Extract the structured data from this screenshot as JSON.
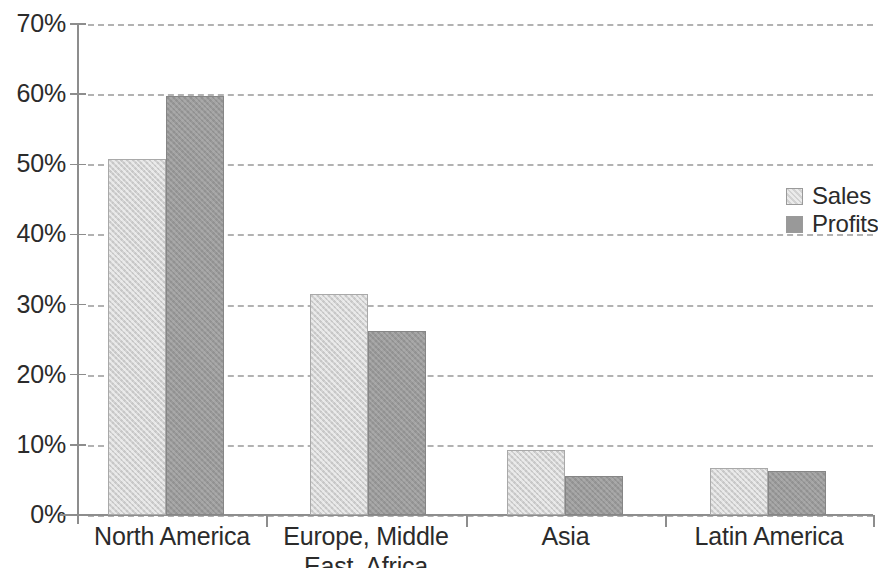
{
  "chart_data": {
    "type": "bar",
    "title": "",
    "subtitle": "",
    "xlabel": "",
    "ylabel": "",
    "categories": [
      "North America",
      "Europe, Middle East, Africa",
      "Asia",
      "Latin America"
    ],
    "series": [
      {
        "name": "Sales",
        "color": "#d2d2d2",
        "values": [
          50.7,
          31.5,
          9.3,
          6.7
        ]
      },
      {
        "name": "Profits",
        "color": "#999999",
        "values": [
          59.8,
          26.2,
          5.6,
          6.3
        ]
      }
    ],
    "ylim": [
      0,
      70
    ],
    "ytick_values": [
      70,
      60,
      50,
      40,
      30,
      20,
      10,
      0
    ],
    "ytick_labels": [
      "70%",
      "60%",
      "50%",
      "40%",
      "30%",
      "20%",
      "10%",
      "0%"
    ],
    "grid": "horizontal-dashed",
    "legend_position": "right",
    "legend_entries": [
      "Sales",
      "Profits"
    ],
    "axis_color": "#8d8d8d",
    "gridline_color": "#b2b2b2",
    "text_color": "#2b2b2b",
    "background": "#ffffff"
  },
  "legend": {
    "items": [
      {
        "label": "Sales"
      },
      {
        "label": "Profits"
      }
    ]
  }
}
